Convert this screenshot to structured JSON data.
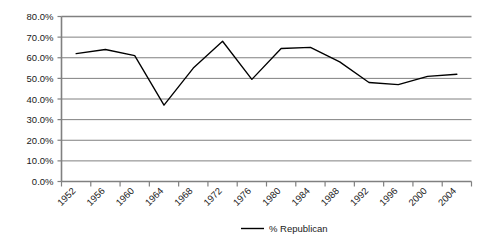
{
  "chart_data": {
    "type": "line",
    "title": "",
    "subtitle": "",
    "xlabel": "",
    "ylabel": "",
    "categories": [
      "1952",
      "1956",
      "1960",
      "1964",
      "1968",
      "1972",
      "1976",
      "1980",
      "1984",
      "1988",
      "1992",
      "1996",
      "2000",
      "2004"
    ],
    "x": [
      1952,
      1956,
      1960,
      1964,
      1968,
      1972,
      1976,
      1980,
      1984,
      1988,
      1992,
      1996,
      2000,
      2004
    ],
    "series": [
      {
        "name": "% Republican",
        "color": "#000000",
        "values": [
          62.0,
          64.0,
          61.0,
          37.0,
          55.0,
          68.0,
          49.5,
          64.5,
          65.0,
          58.0,
          48.0,
          47.0,
          51.0,
          52.0
        ]
      }
    ],
    "ylim": [
      0,
      80
    ],
    "ytick_values": [
      0,
      10,
      20,
      30,
      40,
      50,
      60,
      70,
      80
    ],
    "ytick_labels": [
      "0.0%",
      "10.0%",
      "20.0%",
      "30.0%",
      "40.0%",
      "50.0%",
      "60.0%",
      "70.0%",
      "80.0%"
    ],
    "grid": true,
    "grid_axis": "y",
    "legend": [
      "% Republican"
    ],
    "legend_position": "bottom",
    "annotations": []
  },
  "axes": {
    "y": {
      "tick_labels": [
        "80.0%",
        "70.0%",
        "60.0%",
        "50.0%",
        "40.0%",
        "30.0%",
        "20.0%",
        "10.0%",
        "0.0%"
      ]
    },
    "x": {
      "tick_labels": [
        "1952",
        "1956",
        "1960",
        "1964",
        "1968",
        "1972",
        "1976",
        "1980",
        "1984",
        "1988",
        "1992",
        "1996",
        "2000",
        "2004"
      ]
    }
  },
  "legend": {
    "entries": [
      {
        "label": "% Republican",
        "color": "#000000"
      }
    ]
  },
  "style": {
    "series_color": "#000000",
    "grid_color": "#808080",
    "axis_color": "#808080",
    "background": "#ffffff"
  }
}
